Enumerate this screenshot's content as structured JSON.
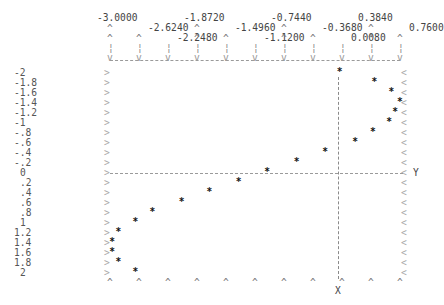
{
  "chart_data": {
    "type": "scatter",
    "title": "",
    "xlabel": "X",
    "ylabel": "Y",
    "x_ticks": [
      "-3.0000",
      "-2.6240",
      "-2.2480",
      "-1.8720",
      "-1.4960",
      "-1.1200",
      "-0.7440",
      "-0.3680",
      "0.0080",
      "0.3840",
      "0.7600"
    ],
    "y_ticks": [
      "-2",
      "-1.8",
      "-1.6",
      "-1.4",
      "-1.2",
      "-1",
      "-.8",
      "-.6",
      "-.4",
      "-.2",
      "0",
      ".2",
      ".4",
      ".6",
      ".8",
      "1",
      "1.2",
      "1.4",
      "1.6",
      "1.8",
      "2"
    ],
    "xlim": [
      -3.0,
      0.76
    ],
    "ylim": [
      2,
      -2
    ],
    "grid": false,
    "marker": "*",
    "points": [
      {
        "x": -0.02,
        "y": -2.0
      },
      {
        "x": 0.43,
        "y": -1.8
      },
      {
        "x": 0.65,
        "y": -1.6
      },
      {
        "x": 0.76,
        "y": -1.4
      },
      {
        "x": 0.7,
        "y": -1.2
      },
      {
        "x": 0.62,
        "y": -1.0
      },
      {
        "x": 0.41,
        "y": -0.8
      },
      {
        "x": 0.18,
        "y": -0.6
      },
      {
        "x": -0.21,
        "y": -0.4
      },
      {
        "x": -0.58,
        "y": -0.2
      },
      {
        "x": -0.96,
        "y": 0.0
      },
      {
        "x": -1.33,
        "y": 0.2
      },
      {
        "x": -1.71,
        "y": 0.4
      },
      {
        "x": -2.07,
        "y": 0.6
      },
      {
        "x": -2.45,
        "y": 0.8
      },
      {
        "x": -2.67,
        "y": 1.0
      },
      {
        "x": -2.89,
        "y": 1.2
      },
      {
        "x": -2.97,
        "y": 1.4
      },
      {
        "x": -2.97,
        "y": 1.6
      },
      {
        "x": -2.89,
        "y": 1.8
      },
      {
        "x": -2.67,
        "y": 2.0
      }
    ],
    "x_axis_line_at": 0.0,
    "y_axis_line_at": 0.0
  },
  "labels": {
    "x_axis": "X",
    "y_axis": "Y"
  }
}
